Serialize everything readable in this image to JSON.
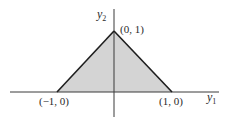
{
  "diagram": {
    "type": "triangle-region",
    "axes": {
      "horizontal_label": "y",
      "horizontal_subscript": "1",
      "vertical_label": "y",
      "vertical_subscript": "2"
    },
    "vertices": [
      {
        "label": "(−1, 0)",
        "x": -1,
        "y": 0
      },
      {
        "label": "(0, 1)",
        "x": 0,
        "y": 1
      },
      {
        "label": "(1, 0)",
        "x": 1,
        "y": 0
      }
    ],
    "colors": {
      "fill": "#d4d4d4",
      "edge": "#1e1e1e",
      "axis": "#3a3a3a"
    }
  }
}
